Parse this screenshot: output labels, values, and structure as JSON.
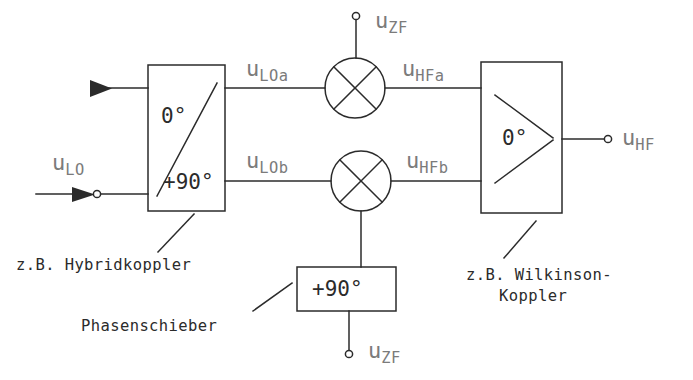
{
  "diagram": {
    "type": "block-diagram",
    "stroke_color": "#2b2b2b",
    "label_color": "#7b7b7b",
    "background": "#ffffff"
  },
  "signals": {
    "lo_in": "u",
    "lo_in_sub": "LO",
    "lo_a": "u",
    "lo_a_sub": "LOa",
    "lo_b": "u",
    "lo_b_sub": "LOb",
    "zf_top": "u",
    "zf_top_sub": "ZF",
    "zf_bottom": "u",
    "zf_bottom_sub": "ZF",
    "hf_a": "u",
    "hf_a_sub": "HFa",
    "hf_b": "u",
    "hf_b_sub": "HFb",
    "hf_out": "u",
    "hf_out_sub": "HF"
  },
  "blocks": {
    "hybrid": {
      "port_top_label": "0°",
      "port_bottom_label": "+90°",
      "caption": "z.B. Hybridkoppler"
    },
    "phase_shifter": {
      "label": "+90°",
      "caption": "Phasenschieber"
    },
    "wilkinson": {
      "label": "0°",
      "caption_line1": "z.B. Wilkinson-",
      "caption_line2": "Koppler"
    },
    "mixer_top": {
      "symbol": "mixer-cross"
    },
    "mixer_bottom": {
      "symbol": "mixer-cross"
    }
  }
}
